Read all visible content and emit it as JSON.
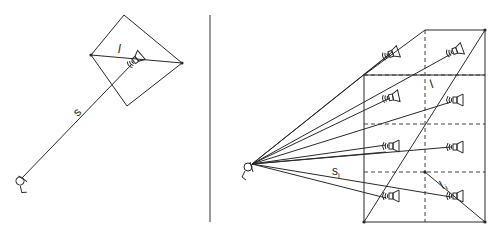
{
  "figure": {
    "left_panel": {
      "title": "single source",
      "labels": {
        "distance": "s",
        "length": "l"
      },
      "listener": {
        "x": 20,
        "y": 180
      },
      "speaker": {
        "x": 133,
        "y": 63
      },
      "diamond": [
        [
          124,
          15
        ],
        [
          182,
          63
        ],
        [
          127,
          106
        ],
        [
          91,
          55
        ]
      ]
    },
    "right_panel": {
      "title": "speaker array",
      "labels": {
        "distance": "s",
        "distance_sub": "i",
        "length": "l",
        "length_sub": "i"
      },
      "listener": {
        "x": 250,
        "y": 165
      },
      "speakers": [
        {
          "x": 392,
          "y": 52
        },
        {
          "x": 458,
          "y": 48
        },
        {
          "x": 390,
          "y": 98
        },
        {
          "x": 458,
          "y": 100
        },
        {
          "x": 392,
          "y": 146
        },
        {
          "x": 458,
          "y": 147
        },
        {
          "x": 392,
          "y": 196
        },
        {
          "x": 458,
          "y": 196
        }
      ]
    },
    "colors": {
      "line": "#2a2a2a",
      "background": "#ffffff"
    }
  }
}
